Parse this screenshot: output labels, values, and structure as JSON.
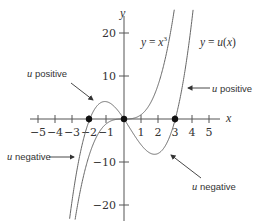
{
  "chart_data": {
    "type": "line",
    "title": "",
    "xlabel": "x",
    "ylabel": "y",
    "xlim": [
      -5.5,
      5.8
    ],
    "ylim": [
      -23,
      25
    ],
    "grid": false,
    "x_ticks": [
      -5,
      -4,
      -3,
      -2,
      -1,
      1,
      2,
      3,
      4,
      5
    ],
    "x_tick_labels": [
      "−5",
      "−4",
      "−3",
      "−2",
      "−1",
      "1",
      "2",
      "3",
      "4",
      "5"
    ],
    "y_ticks": [
      20,
      10,
      -10,
      -20
    ],
    "y_tick_labels": [
      "20",
      "10",
      "−10",
      "−20"
    ],
    "series": [
      {
        "name": "y = x³",
        "formula": "x^3",
        "label_parts": [
          "y",
          " = ",
          "x",
          "3"
        ]
      },
      {
        "name": "y = u(x)",
        "formula": "x(x+2)(x-3) = x^3 - x^2 - 6x",
        "label_parts": [
          "y",
          " = ",
          "u",
          "(",
          "x",
          ")"
        ]
      }
    ],
    "points": [
      {
        "x": -2,
        "y": 0
      },
      {
        "x": 0,
        "y": 0
      },
      {
        "x": 3,
        "y": 0
      }
    ],
    "annotations": [
      {
        "text_u": "u",
        "text": " positive",
        "target": "u(x) on (-2, 0)"
      },
      {
        "text_u": "u",
        "text": " positive",
        "target": "u(x) for x > 3"
      },
      {
        "text_u": "u",
        "text": " negative",
        "target": "u(x) for x < -2"
      },
      {
        "text_u": "u",
        "text": " negative",
        "target": "u(x) on (0, 3)"
      }
    ]
  },
  "labels": {
    "x_axis": "x",
    "y_axis": "y",
    "curve1": {
      "y": "y",
      "eq": " = ",
      "x": "x",
      "exp": "3"
    },
    "curve2": {
      "y": "y",
      "eq": " = ",
      "u": "u",
      "lp": "(",
      "x": "x",
      "rp": ")"
    },
    "ann": [
      {
        "u": "u",
        "t": " positive"
      },
      {
        "u": "u",
        "t": " positive"
      },
      {
        "u": "u",
        "t": " negative"
      },
      {
        "u": "u",
        "t": " negative"
      }
    ],
    "ticks_x": [
      "−5",
      "−4",
      "−3",
      "−2",
      "−1",
      "1",
      "2",
      "3",
      "4",
      "5"
    ],
    "ticks_y": [
      "20",
      "10",
      "−10",
      "−20"
    ]
  }
}
